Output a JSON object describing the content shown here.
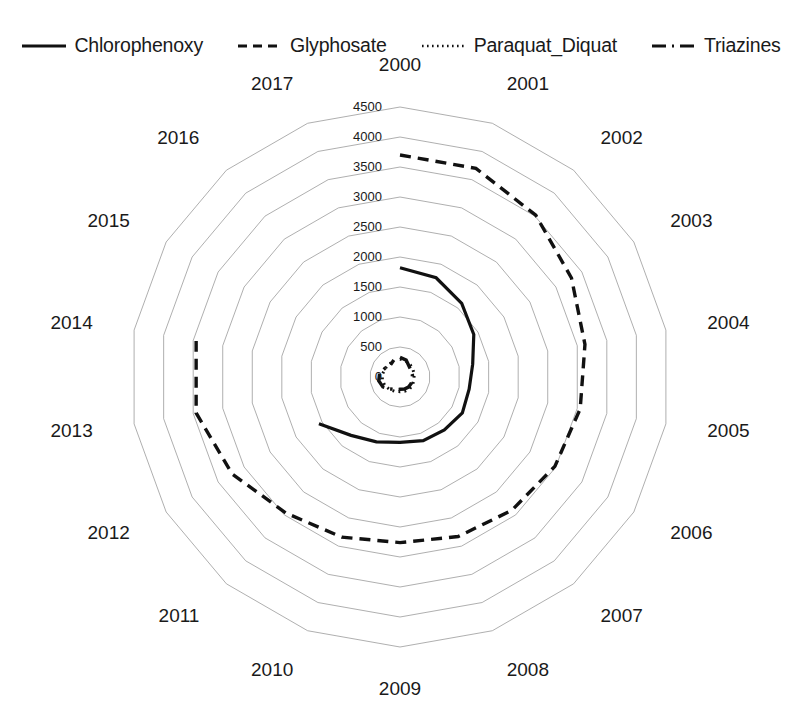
{
  "legend": {
    "position": "top",
    "items": [
      {
        "label": "Chlorophenoxy",
        "style": "solid",
        "color": "#111111"
      },
      {
        "label": "Glyphosate",
        "style": "dashed",
        "color": "#111111"
      },
      {
        "label": "Paraquat_Diquat",
        "style": "dotted",
        "color": "#111111"
      },
      {
        "label": "Triazines",
        "style": "dashdot",
        "color": "#111111"
      }
    ]
  },
  "axis": {
    "radial_ticks": [
      "0",
      "500",
      "1000",
      "1500",
      "2000",
      "2500",
      "3000",
      "3500",
      "4000",
      "4500"
    ],
    "category_labels": [
      "2000",
      "2001",
      "2002",
      "2003",
      "2004",
      "2005",
      "2006",
      "2007",
      "2008",
      "2009",
      "2010",
      "2011",
      "2012",
      "2013",
      "2014",
      "2015",
      "2016",
      "2017"
    ]
  },
  "chart_data": {
    "type": "line",
    "plot_kind": "radar",
    "title": "",
    "subtitle": "",
    "xlabel": "",
    "ylabel": "",
    "categories": [
      "2000",
      "2001",
      "2002",
      "2003",
      "2004",
      "2005",
      "2006",
      "2007",
      "2008",
      "2009",
      "2010",
      "2011",
      "2012",
      "2013",
      "2014",
      "2015",
      "2016",
      "2017"
    ],
    "rlim": [
      0,
      4500
    ],
    "rticks": [
      0,
      500,
      1000,
      1500,
      2000,
      2500,
      3000,
      3500,
      4000,
      4500
    ],
    "grid": true,
    "legend_position": "top",
    "start_angle_deg": 90,
    "direction": "clockwise",
    "series": [
      {
        "name": "Chlorophenoxy",
        "style": "solid",
        "color": "#111111",
        "values": [
          1820,
          1760,
          1600,
          1420,
          1230,
          1170,
          1200,
          1150,
          1130,
          1090,
          1150,
          1270,
          1560,
          null,
          null,
          null,
          null,
          null
        ]
      },
      {
        "name": "Glyphosate",
        "style": "dashed",
        "color": "#111111",
        "values": [
          3700,
          3700,
          3520,
          3300,
          3130,
          3050,
          2980,
          2900,
          2830,
          2760,
          2840,
          2960,
          3230,
          3450,
          3450,
          null,
          null,
          null
        ]
      },
      {
        "name": "Paraquat_Diquat",
        "style": "dotted",
        "color": "#111111",
        "values": [
          300,
          285,
          265,
          250,
          240,
          235,
          245,
          255,
          250,
          245,
          255,
          270,
          290,
          300,
          295,
          285,
          280,
          290
        ]
      },
      {
        "name": "Triazines",
        "style": "dashdot",
        "color": "#111111",
        "values": [
          330,
          300,
          235,
          215,
          210,
          205,
          215,
          220,
          215,
          205,
          220,
          260,
          330,
          360,
          345,
          290,
          255,
          300
        ]
      }
    ]
  },
  "geometry": {
    "center_x": 400,
    "center_y": 377,
    "outer_radius": 270
  }
}
